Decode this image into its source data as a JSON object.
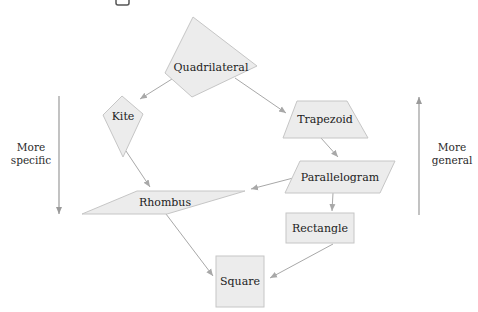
{
  "diagram": {
    "type": "hierarchy",
    "colors": {
      "node_fill": "#ececec",
      "node_stroke": "#c6c6c6",
      "edge": "#a8a8a8",
      "axis": "#9a9a9a",
      "text": "#222222"
    },
    "nodes": [
      {
        "id": "quadrilateral",
        "label": "Quadrilateral",
        "shape": "irregular-quadrilateral"
      },
      {
        "id": "kite",
        "label": "Kite",
        "shape": "kite"
      },
      {
        "id": "trapezoid",
        "label": "Trapezoid",
        "shape": "trapezoid"
      },
      {
        "id": "parallelogram",
        "label": "Parallelogram",
        "shape": "parallelogram"
      },
      {
        "id": "rhombus",
        "label": "Rhombus",
        "shape": "rhombus"
      },
      {
        "id": "rectangle",
        "label": "Rectangle",
        "shape": "rectangle"
      },
      {
        "id": "square",
        "label": "Square",
        "shape": "square"
      }
    ],
    "edges": [
      {
        "from": "quadrilateral",
        "to": "kite"
      },
      {
        "from": "quadrilateral",
        "to": "trapezoid"
      },
      {
        "from": "kite",
        "to": "rhombus"
      },
      {
        "from": "trapezoid",
        "to": "parallelogram"
      },
      {
        "from": "parallelogram",
        "to": "rhombus"
      },
      {
        "from": "parallelogram",
        "to": "rectangle"
      },
      {
        "from": "rhombus",
        "to": "square"
      },
      {
        "from": "rectangle",
        "to": "square"
      }
    ],
    "axes": {
      "left": {
        "line1": "More",
        "line2": "specific",
        "direction": "down"
      },
      "right": {
        "line1": "More",
        "line2": "general",
        "direction": "up"
      }
    }
  }
}
